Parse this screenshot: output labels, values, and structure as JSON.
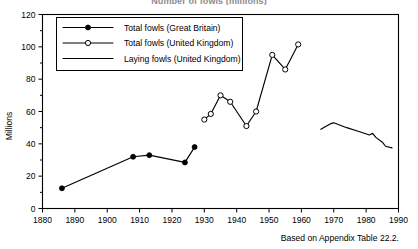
{
  "chart_data": {
    "type": "line",
    "title": "Number of fowls (millions)",
    "xlabel": "",
    "ylabel": "Millions",
    "xlim": [
      1880,
      1990
    ],
    "ylim": [
      0,
      120
    ],
    "xticks": [
      1880,
      1890,
      1900,
      1910,
      1920,
      1930,
      1940,
      1950,
      1960,
      1970,
      1980,
      1990
    ],
    "yticks": [
      0,
      20,
      40,
      60,
      80,
      100,
      120
    ],
    "y_minor_ticks": [
      10,
      30,
      50,
      70,
      90,
      110
    ],
    "grid": false,
    "legend_position": "upper-left",
    "source_note": "Based on Appendix Table 22.2.",
    "series": [
      {
        "name": "Total fowls (Great Britain)",
        "marker": "filled-circle",
        "x": [
          1886,
          1908,
          1913,
          1924,
          1927
        ],
        "values": [
          12.5,
          32.0,
          33.0,
          28.5,
          38.0
        ]
      },
      {
        "name": "Total fowls (United Kingdom)",
        "marker": "open-circle",
        "x": [
          1930,
          1932,
          1935,
          1938,
          1943,
          1946,
          1951,
          1955,
          1959
        ],
        "values": [
          55.0,
          58.5,
          70.0,
          66.0,
          51.0,
          60.0,
          95.0,
          86.0,
          101.5
        ]
      },
      {
        "name": "Laying fowls (United Kingdom)",
        "marker": "none",
        "x": [
          1966,
          1969,
          1970,
          1974,
          1978,
          1981,
          1982,
          1983,
          1985,
          1986,
          1988
        ],
        "values": [
          49.0,
          52.5,
          53.0,
          50.0,
          47.5,
          45.5,
          46.5,
          44.0,
          41.0,
          38.5,
          37.5
        ]
      }
    ]
  }
}
